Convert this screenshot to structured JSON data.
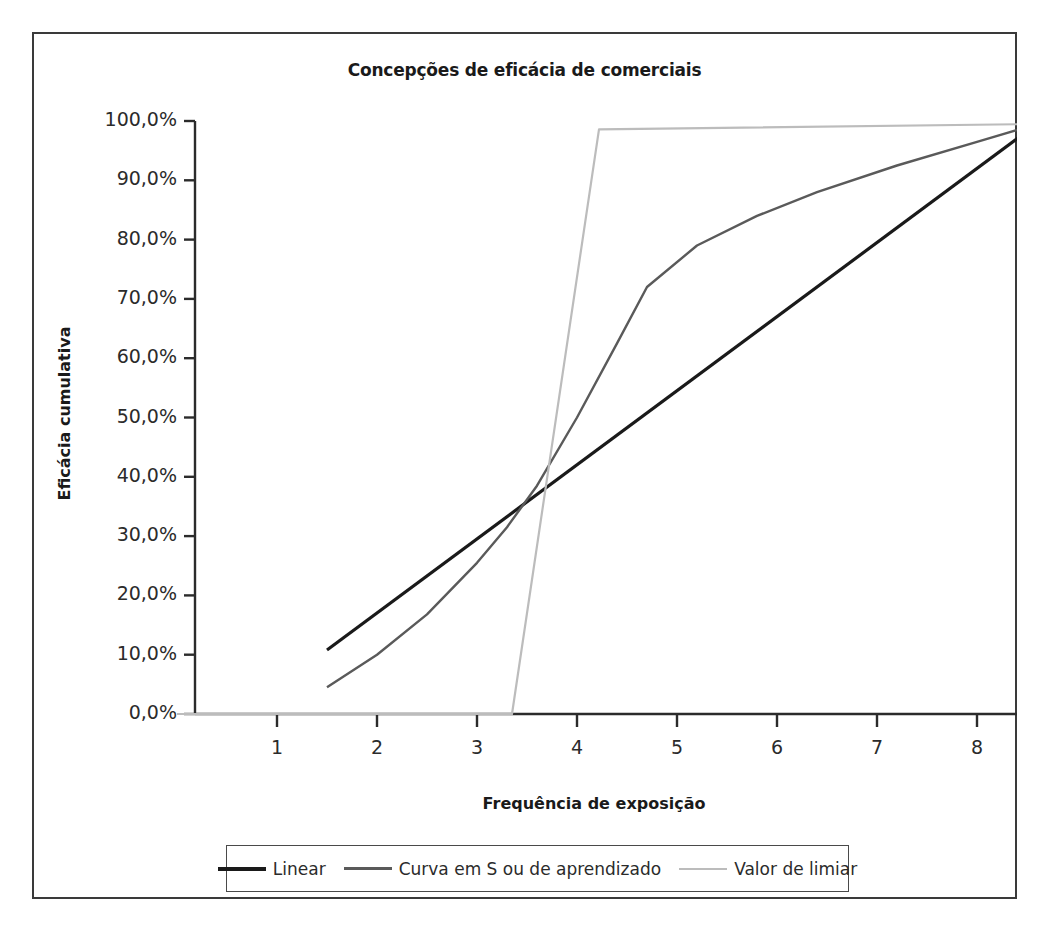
{
  "chart_data": {
    "type": "line",
    "title": "Concepções de eficácia de comerciais",
    "xlabel": "Frequência de exposição",
    "ylabel": "Eficácia cumulativa",
    "xlim": [
      0,
      8.6
    ],
    "ylim": [
      0,
      1.0
    ],
    "grid": false,
    "legend_position": "bottom",
    "x_ticks": [
      "1",
      "2",
      "3",
      "4",
      "5",
      "6",
      "7",
      "8"
    ],
    "x_tick_values": [
      1,
      2,
      3,
      4,
      5,
      6,
      7,
      8
    ],
    "y_ticks": [
      "0,0%",
      "10,0%",
      "20,0%",
      "30,0%",
      "40,0%",
      "50,0%",
      "60,0%",
      "70,0%",
      "80,0%",
      "90,0%",
      "100,0%"
    ],
    "y_tick_values": [
      0,
      10,
      20,
      30,
      40,
      50,
      60,
      70,
      80,
      90,
      100
    ],
    "series": [
      {
        "name": "Linear",
        "color": "#1a1a1a",
        "width": 3.2,
        "x": [
          1.5,
          8.6
        ],
        "values": [
          10.8,
          99.5
        ]
      },
      {
        "name": "Curva em S ou de aprendizado",
        "color": "#5a5a5a",
        "width": 2.4,
        "x": [
          1.5,
          2.0,
          2.5,
          3.0,
          3.3,
          3.6,
          4.0,
          4.4,
          4.7,
          5.2,
          5.8,
          6.4,
          7.2,
          8.0,
          8.6
        ],
        "values": [
          4.5,
          10.0,
          16.8,
          25.5,
          31.5,
          38.5,
          50.0,
          62.5,
          72.0,
          79.0,
          84.0,
          88.0,
          92.5,
          96.5,
          99.5
        ]
      },
      {
        "name": "Valor de limiar",
        "color": "#bcbcbc",
        "width": 2.2,
        "x": [
          0.0,
          3.35,
          4.22,
          8.6
        ],
        "values": [
          0.0,
          0.0,
          98.6,
          99.5
        ]
      }
    ]
  },
  "legend": {
    "items": [
      {
        "label": "Linear",
        "color": "#1a1a1a",
        "thickness": "4px"
      },
      {
        "label": "Curva em S ou de aprendizado",
        "color": "#5a5a5a",
        "thickness": "3px"
      },
      {
        "label": "Valor de limiar",
        "color": "#bcbcbc",
        "thickness": "2px"
      }
    ]
  },
  "colors": {
    "frame": "#3a3a3a",
    "axis": "#2b2b2b",
    "background": "#ffffff"
  }
}
